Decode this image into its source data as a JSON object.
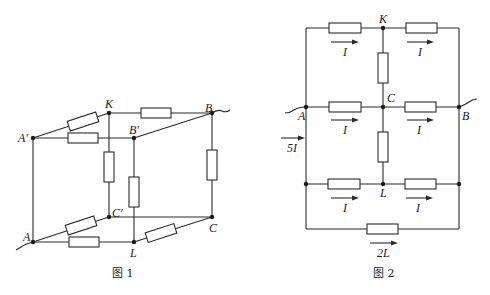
{
  "figure1": {
    "caption": "图 1",
    "nodes": {
      "A_prime": "A′",
      "K": "K",
      "B": "B",
      "B_prime": "B′",
      "C_prime": "C′",
      "A": "A",
      "L": "L",
      "C": "C"
    }
  },
  "figure2": {
    "caption": "图 2",
    "nodes": {
      "K": "K",
      "C": "C",
      "A": "A",
      "B": "B",
      "L": "L"
    },
    "currents": {
      "top_left": "I",
      "top_right": "I",
      "mid_left": "I",
      "mid_right": "I",
      "low_left": "I",
      "low_right": "I",
      "bottom": "2L",
      "input": "5I"
    }
  },
  "colors": {
    "line": "#2a2a2a",
    "background": "#ffffff"
  }
}
